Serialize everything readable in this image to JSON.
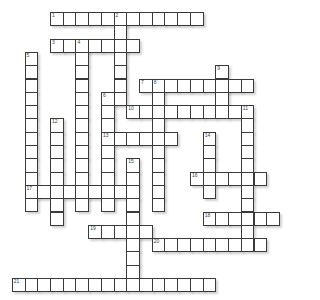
{
  "puzzle": {
    "type": "crossword",
    "layout": {
      "origin_x": 50,
      "origin_y": 12,
      "cell_w": 12.72,
      "cell_h": 13.3
    },
    "words": [
      {
        "number": 1,
        "dir": "across",
        "col": 0,
        "row": 0,
        "length": 12
      },
      {
        "number": 2,
        "dir": "down",
        "col": 5,
        "row": 0,
        "length": 7
      },
      {
        "number": 3,
        "dir": "across",
        "col": 0,
        "row": 2,
        "length": 7
      },
      {
        "number": 4,
        "dir": "down",
        "col": 2,
        "row": 2,
        "length": 13
      },
      {
        "number": 5,
        "dir": "down",
        "col": -2,
        "row": 3,
        "length": 12
      },
      {
        "number": 6,
        "dir": "down",
        "col": 4,
        "row": 6,
        "length": 9
      },
      {
        "number": 7,
        "dir": "across",
        "col": 7,
        "row": 5,
        "length": 9
      },
      {
        "number": 8,
        "dir": "down",
        "col": 8,
        "row": 5,
        "length": 10
      },
      {
        "number": 9,
        "dir": "down",
        "col": 13,
        "row": 4,
        "length": 4
      },
      {
        "number": 10,
        "dir": "across",
        "col": 6,
        "row": 7,
        "length": 10
      },
      {
        "number": 11,
        "dir": "down",
        "col": 15,
        "row": 7,
        "length": 11
      },
      {
        "number": 12,
        "dir": "down",
        "col": 0,
        "row": 8,
        "length": 8
      },
      {
        "number": 13,
        "dir": "across",
        "col": 4,
        "row": 9,
        "length": 6
      },
      {
        "number": 14,
        "dir": "down",
        "col": 12,
        "row": 9,
        "length": 5
      },
      {
        "number": 15,
        "dir": "down",
        "col": 6,
        "row": 11,
        "length": 10
      },
      {
        "number": 16,
        "dir": "across",
        "col": 11,
        "row": 12,
        "length": 6
      },
      {
        "number": 17,
        "dir": "across",
        "col": -2,
        "row": 13,
        "length": 9
      },
      {
        "number": 18,
        "dir": "across",
        "col": 12,
        "row": 15,
        "length": 6
      },
      {
        "number": 19,
        "dir": "across",
        "col": 3,
        "row": 16,
        "length": 5
      },
      {
        "number": 20,
        "dir": "across",
        "col": 8,
        "row": 17,
        "length": 9
      },
      {
        "number": 21,
        "dir": "across",
        "col": -3,
        "row": 20,
        "length": 16
      }
    ],
    "colors": {
      "border": "#3a3a3a",
      "cell": "#ffffff",
      "number": "#444444"
    }
  }
}
